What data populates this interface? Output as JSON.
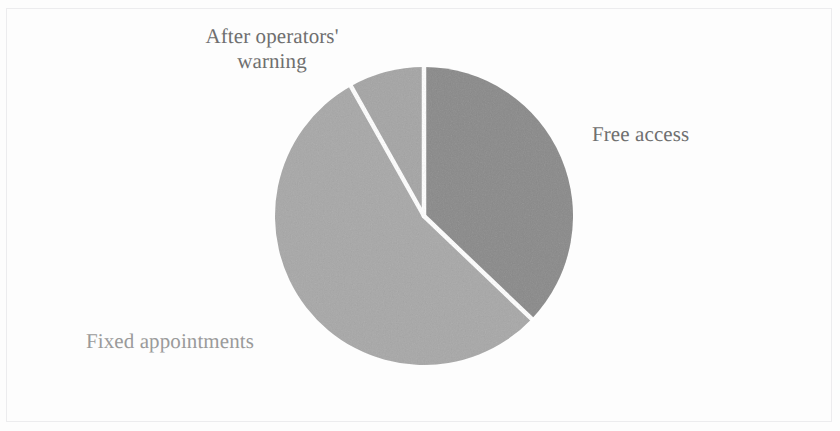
{
  "figure": {
    "background_color": "#fdfdfd",
    "frame_color": "#e6e6e8",
    "label_color": "#6f6f6f",
    "label_color_light": "#9a9a9a",
    "separator_color": "#ffffff"
  },
  "chart_data": {
    "type": "pie",
    "title": "",
    "subtitle": "",
    "xlabel": "",
    "ylabel": "",
    "grid": false,
    "legend_position": "none",
    "label_placement": "outside-callout",
    "start_angle_deg": 0,
    "direction": "clockwise",
    "categories": [
      "Free access",
      "Fixed appointments",
      "After operators' warning"
    ],
    "values": [
      37,
      55,
      8
    ],
    "slices": [
      {
        "label": "Free access",
        "value": 37,
        "percent": 37,
        "color": "#8a8a8a",
        "start_angle_deg": 0,
        "end_angle_deg": 133.7
      },
      {
        "label": "Fixed appointments",
        "value": 55,
        "percent": 55,
        "color": "#a8a8a8",
        "start_angle_deg": 133.7,
        "end_angle_deg": 330.6
      },
      {
        "label": "After operators' warning",
        "value": 8,
        "percent": 8,
        "color": "#a5a5a5",
        "start_angle_deg": 330.6,
        "end_angle_deg": 360
      }
    ]
  },
  "labels": {
    "free_access": "Free access",
    "fixed_appointments": "Fixed appointments",
    "after_operators_warning": "After operators'\nwarning"
  }
}
